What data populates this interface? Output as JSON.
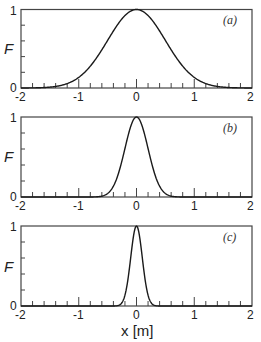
{
  "chart_data": [
    {
      "type": "line",
      "panel": "(a)",
      "title": "",
      "xlabel": "",
      "ylabel": "F",
      "xlim": [
        -2,
        2
      ],
      "ylim": [
        0,
        1
      ],
      "x_ticks": [
        -2,
        -1,
        0,
        1,
        2
      ],
      "y_ticks": [
        0,
        1
      ],
      "minor_tick_step": 0.2,
      "grid": false,
      "series": [
        {
          "name": "F(x)",
          "x": [
            -2,
            -1.75,
            -1.5,
            -1.25,
            -1,
            -0.75,
            -0.5,
            -0.25,
            0,
            0.25,
            0.5,
            0.75,
            1,
            1.25,
            1.5,
            1.75,
            2
          ],
          "values": [
            0.0003,
            0.002,
            0.011,
            0.044,
            0.135,
            0.325,
            0.607,
            0.882,
            1.0,
            0.882,
            0.607,
            0.325,
            0.135,
            0.044,
            0.011,
            0.002,
            0.0003
          ],
          "sigma": 0.5
        }
      ]
    },
    {
      "type": "line",
      "panel": "(b)",
      "title": "",
      "xlabel": "",
      "ylabel": "F",
      "xlim": [
        -2,
        2
      ],
      "ylim": [
        0,
        1
      ],
      "x_ticks": [
        -2,
        -1,
        0,
        1,
        2
      ],
      "y_ticks": [
        0,
        1
      ],
      "minor_tick_step": 0.2,
      "grid": false,
      "series": [
        {
          "name": "F(x)",
          "x": [
            -0.6,
            -0.5,
            -0.4,
            -0.3,
            -0.2,
            -0.1,
            0,
            0.1,
            0.2,
            0.3,
            0.4,
            0.5,
            0.6
          ],
          "values": [
            0.011,
            0.044,
            0.135,
            0.325,
            0.607,
            0.882,
            1.0,
            0.882,
            0.607,
            0.325,
            0.135,
            0.044,
            0.011
          ],
          "sigma": 0.2
        }
      ]
    },
    {
      "type": "line",
      "panel": "(c)",
      "title": "",
      "xlabel": "x [m]",
      "ylabel": "F",
      "xlim": [
        -2,
        2
      ],
      "ylim": [
        0,
        1
      ],
      "x_ticks": [
        -2,
        -1,
        0,
        1,
        2
      ],
      "y_ticks": [
        0,
        1
      ],
      "minor_tick_step": 0.2,
      "grid": false,
      "series": [
        {
          "name": "F(x)",
          "x": [
            -0.3,
            -0.25,
            -0.2,
            -0.15,
            -0.1,
            -0.05,
            0,
            0.05,
            0.1,
            0.15,
            0.2,
            0.25,
            0.3
          ],
          "values": [
            0.011,
            0.044,
            0.135,
            0.325,
            0.607,
            0.882,
            1.0,
            0.882,
            0.607,
            0.325,
            0.135,
            0.044,
            0.011
          ],
          "sigma": 0.1
        }
      ]
    }
  ],
  "panels": [
    {
      "label": "(a)",
      "ylabel": "F",
      "y_top": "1",
      "y_bottom": "0",
      "sigma": 0.5
    },
    {
      "label": "(b)",
      "ylabel": "F",
      "y_top": "1",
      "y_bottom": "0",
      "sigma": 0.2
    },
    {
      "label": "(c)",
      "ylabel": "F",
      "y_top": "1",
      "y_bottom": "0",
      "sigma": 0.1
    }
  ],
  "x_tick_labels": [
    "-2",
    "-1",
    "0",
    "1",
    "2"
  ],
  "xlabel": "x [m]",
  "style": {
    "line_color": "#1a1a1a",
    "frame_color": "#444444"
  }
}
